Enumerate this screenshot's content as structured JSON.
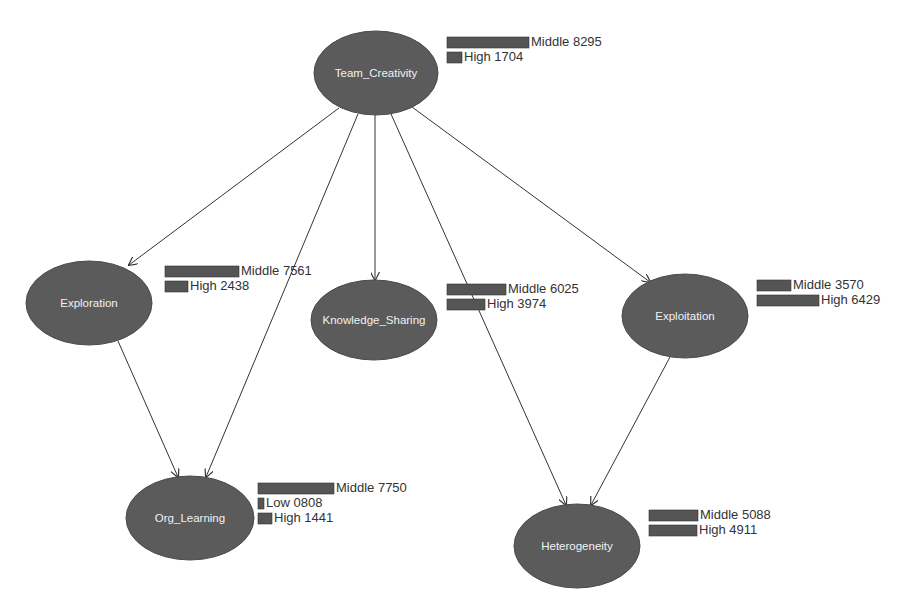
{
  "diagram": {
    "type": "bayesian-network",
    "nodes": [
      {
        "id": "team_creativity",
        "label": "Team_Creativity",
        "cx": 376,
        "cy": 73,
        "rx": 62,
        "ry": 42,
        "bars_x": 447,
        "bars_y": 37,
        "states": [
          {
            "name": "Middle",
            "value": "8295",
            "width": 82
          },
          {
            "name": "High",
            "value": "1704",
            "width": 15
          }
        ]
      },
      {
        "id": "exploration",
        "label": "Exploration",
        "cx": 89,
        "cy": 303,
        "rx": 63,
        "ry": 42,
        "bars_x": 165,
        "bars_y": 266,
        "states": [
          {
            "name": "Middle",
            "value": "7561",
            "width": 74
          },
          {
            "name": "High",
            "value": "2438",
            "width": 23
          }
        ]
      },
      {
        "id": "knowledge_sharing",
        "label": "Knowledge_Sharing",
        "cx": 374,
        "cy": 320,
        "rx": 63,
        "ry": 40,
        "bars_x": 447,
        "bars_y": 284,
        "states": [
          {
            "name": "Middle",
            "value": "6025",
            "width": 59
          },
          {
            "name": "High",
            "value": "3974",
            "width": 38
          }
        ]
      },
      {
        "id": "exploitation",
        "label": "Exploitation",
        "cx": 685,
        "cy": 316,
        "rx": 63,
        "ry": 42,
        "bars_x": 757,
        "bars_y": 280,
        "states": [
          {
            "name": "Middle",
            "value": "3570",
            "width": 34
          },
          {
            "name": "High",
            "value": "6429",
            "width": 62
          }
        ]
      },
      {
        "id": "org_learning",
        "label": "Org_Learning",
        "cx": 190,
        "cy": 518,
        "rx": 64,
        "ry": 42,
        "bars_x": 258,
        "bars_y": 483,
        "states": [
          {
            "name": "Middle",
            "value": "7750",
            "width": 76
          },
          {
            "name": "Low",
            "value": "0808",
            "width": 6
          },
          {
            "name": "High",
            "value": "1441",
            "width": 14
          }
        ]
      },
      {
        "id": "heterogeneity",
        "label": "Heterogeneity",
        "cx": 577,
        "cy": 546,
        "rx": 63,
        "ry": 42,
        "bars_x": 649,
        "bars_y": 510,
        "states": [
          {
            "name": "Middle",
            "value": "5088",
            "width": 49
          },
          {
            "name": "High",
            "value": "4911",
            "width": 48
          }
        ]
      }
    ],
    "edges": [
      {
        "from": "team_creativity",
        "to": "exploration",
        "x1": 339,
        "y1": 108,
        "x2": 129,
        "y2": 265
      },
      {
        "from": "team_creativity",
        "to": "org_learning",
        "x1": 358,
        "y1": 114,
        "x2": 206,
        "y2": 477
      },
      {
        "from": "team_creativity",
        "to": "knowledge_sharing",
        "x1": 375,
        "y1": 115,
        "x2": 375,
        "y2": 280
      },
      {
        "from": "team_creativity",
        "to": "heterogeneity",
        "x1": 391,
        "y1": 114,
        "x2": 566,
        "y2": 505
      },
      {
        "from": "team_creativity",
        "to": "exploitation",
        "x1": 412,
        "y1": 107,
        "x2": 650,
        "y2": 282
      },
      {
        "from": "exploration",
        "to": "org_learning",
        "x1": 118,
        "y1": 341,
        "x2": 178,
        "y2": 477
      },
      {
        "from": "exploitation",
        "to": "heterogeneity",
        "x1": 670,
        "y1": 357,
        "x2": 591,
        "y2": 505
      }
    ],
    "colors": {
      "node_fill": "#5b5b5b",
      "bar_fill": "#555555",
      "edge": "#333333",
      "label": "#f2f2f2",
      "text": "#333333"
    }
  }
}
